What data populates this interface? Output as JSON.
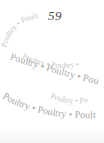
{
  "page": {
    "number": "59"
  },
  "spiral": {
    "word": "Poultry",
    "separator": "•",
    "ribbon_text_top": "Poultry • Poultry",
    "ribbon_text_back_1": "Poultry • Poultry •",
    "ribbon_text_front_1": "Poultry • Poultry • Poultry",
    "ribbon_text_back_2": "Poultry • Poultry •",
    "ribbon_text_front_2": "Poultry • Poultry • Poultry",
    "text_color": "#a8a8a8"
  }
}
